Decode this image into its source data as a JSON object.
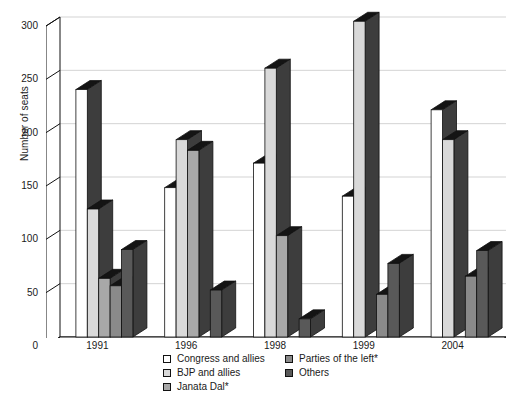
{
  "chart_data": {
    "type": "bar",
    "title": "",
    "xlabel": "",
    "ylabel": "Number of seats",
    "ylim": [
      0,
      300
    ],
    "yticks": [
      0,
      50,
      100,
      150,
      200,
      250,
      300
    ],
    "ytick_labels": [
      "0",
      "50",
      "100",
      "150",
      "200",
      "250",
      "300"
    ],
    "grid": true,
    "legend_position": "bottom",
    "style": "3d-grouped-bars",
    "categories": [
      "1991",
      "1996",
      "1998",
      "1999",
      "2004"
    ],
    "series": [
      {
        "name": "Congress and allies",
        "color": "#ffffff",
        "values": [
          232,
          140,
          163,
          132,
          213
        ]
      },
      {
        "name": "BJP and allies",
        "color": "#d9d9d9",
        "values": [
          120,
          185,
          252,
          296,
          185
        ]
      },
      {
        "name": "Janata Dal*",
        "color": "#a8a8a8",
        "values": [
          55,
          175,
          95,
          0,
          0
        ]
      },
      {
        "name": "Parties of the left*",
        "color": "#8a8a8a",
        "values": [
          48,
          0,
          0,
          40,
          57
        ]
      },
      {
        "name": "Others",
        "color": "#595959",
        "values": [
          82,
          44,
          17,
          69,
          81
        ]
      }
    ]
  },
  "axis": {
    "y_title": "Number of seats",
    "y_tick_labels": [
      "300",
      "250",
      "200",
      "150",
      "100",
      "50",
      "0"
    ],
    "x_tick_labels": [
      "1991",
      "1996",
      "1998",
      "1999",
      "2004"
    ]
  },
  "legend": {
    "column_1": [
      {
        "label": "Congress and allies",
        "swatch": "#ffffff"
      },
      {
        "label": "BJP and allies",
        "swatch": "#d9d9d9"
      },
      {
        "label": "Janata Dal*",
        "swatch": "#a8a8a8"
      }
    ],
    "column_2": [
      {
        "label": "Parties of the left*",
        "swatch": "#8a8a8a"
      },
      {
        "label": "Others",
        "swatch": "#595959"
      }
    ]
  },
  "footnote": {
    "text": ""
  }
}
